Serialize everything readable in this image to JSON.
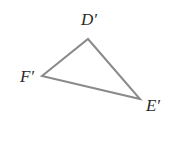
{
  "figure": {
    "type": "triangle",
    "stroke_color": "#8a8a8a",
    "label_color": "#2a2a2a",
    "vertices": [
      {
        "id": "D",
        "label": "D′",
        "x": 88,
        "y": 39,
        "label_x": 89,
        "label_y": 25
      },
      {
        "id": "E",
        "label": "E′",
        "x": 140,
        "y": 99,
        "label_x": 153,
        "label_y": 111
      },
      {
        "id": "F",
        "label": "F′",
        "x": 42,
        "y": 76,
        "label_x": 27,
        "label_y": 82
      }
    ]
  }
}
